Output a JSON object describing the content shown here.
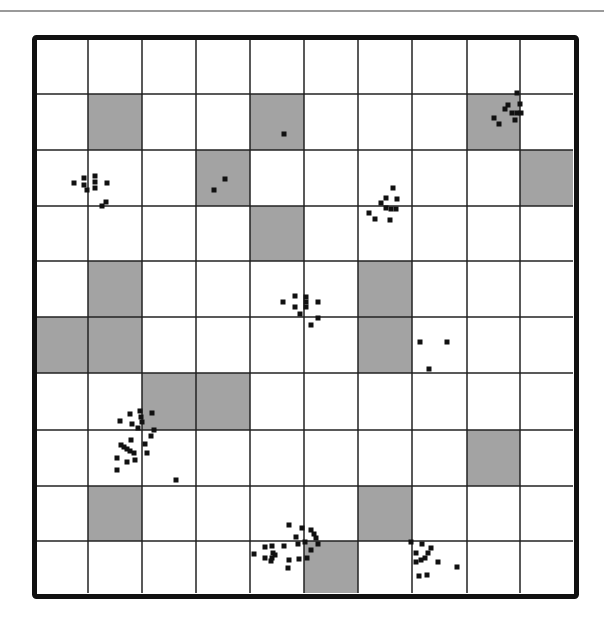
{
  "diagram": {
    "type": "grid-map",
    "rows": 10,
    "cols": 10,
    "frame": {
      "x": 32,
      "y": 35,
      "width": 547,
      "height": 564,
      "border_width": 5
    },
    "inner": {
      "x0": 37,
      "y0": 38,
      "x1": 573,
      "y1": 593
    },
    "col_edges": [
      37,
      88,
      142,
      196,
      250,
      304,
      358,
      412,
      467,
      520,
      573
    ],
    "row_edges": [
      38,
      94,
      150,
      206,
      261,
      317,
      373,
      430,
      486,
      541,
      593
    ],
    "colors": {
      "background": "#ffffff",
      "shaded_cell": "#a3a3a3",
      "grid_line": "#222222",
      "border": "#111111",
      "dot": "#111111",
      "top_rule": "#9a9a9a"
    },
    "shaded_cells": [
      {
        "row": 1,
        "col": 1
      },
      {
        "row": 1,
        "col": 4
      },
      {
        "row": 1,
        "col": 8
      },
      {
        "row": 2,
        "col": 3
      },
      {
        "row": 2,
        "col": 9
      },
      {
        "row": 3,
        "col": 4
      },
      {
        "row": 4,
        "col": 1
      },
      {
        "row": 4,
        "col": 6
      },
      {
        "row": 5,
        "col": 0
      },
      {
        "row": 5,
        "col": 1
      },
      {
        "row": 5,
        "col": 6
      },
      {
        "row": 6,
        "col": 2
      },
      {
        "row": 6,
        "col": 3
      },
      {
        "row": 7,
        "col": 8
      },
      {
        "row": 8,
        "col": 1
      },
      {
        "row": 8,
        "col": 6
      },
      {
        "row": 9,
        "col": 5
      }
    ],
    "dot_size": 5,
    "dots": [
      [
        74,
        183
      ],
      [
        84,
        178
      ],
      [
        84,
        185
      ],
      [
        87,
        190
      ],
      [
        95,
        176
      ],
      [
        95,
        182
      ],
      [
        95,
        188
      ],
      [
        107,
        183
      ],
      [
        102,
        206
      ],
      [
        106,
        202
      ],
      [
        284,
        134
      ],
      [
        225,
        179
      ],
      [
        214,
        190
      ],
      [
        393,
        188
      ],
      [
        386,
        198
      ],
      [
        397,
        199
      ],
      [
        381,
        203
      ],
      [
        386,
        208
      ],
      [
        391,
        209
      ],
      [
        396,
        209
      ],
      [
        369,
        213
      ],
      [
        375,
        219
      ],
      [
        390,
        220
      ],
      [
        517,
        93
      ],
      [
        508,
        105
      ],
      [
        505,
        109
      ],
      [
        520,
        104
      ],
      [
        512,
        113
      ],
      [
        517,
        113
      ],
      [
        521,
        113
      ],
      [
        494,
        118
      ],
      [
        499,
        124
      ],
      [
        515,
        120
      ],
      [
        283,
        302
      ],
      [
        295,
        296
      ],
      [
        295,
        307
      ],
      [
        306,
        297
      ],
      [
        306,
        302
      ],
      [
        306,
        307
      ],
      [
        318,
        302
      ],
      [
        300,
        314
      ],
      [
        318,
        318
      ],
      [
        311,
        325
      ],
      [
        420,
        342
      ],
      [
        447,
        342
      ],
      [
        429,
        369
      ],
      [
        120,
        421
      ],
      [
        130,
        414
      ],
      [
        132,
        424
      ],
      [
        140,
        411
      ],
      [
        141,
        417
      ],
      [
        142,
        422
      ],
      [
        152,
        413
      ],
      [
        138,
        428
      ],
      [
        154,
        430
      ],
      [
        151,
        436
      ],
      [
        121,
        445
      ],
      [
        124,
        447
      ],
      [
        127,
        449
      ],
      [
        130,
        451
      ],
      [
        134,
        453
      ],
      [
        131,
        440
      ],
      [
        145,
        444
      ],
      [
        147,
        453
      ],
      [
        117,
        458
      ],
      [
        127,
        462
      ],
      [
        135,
        460
      ],
      [
        117,
        470
      ],
      [
        176,
        480
      ],
      [
        289,
        525
      ],
      [
        302,
        528
      ],
      [
        296,
        537
      ],
      [
        311,
        530
      ],
      [
        314,
        534
      ],
      [
        316,
        538
      ],
      [
        305,
        542
      ],
      [
        318,
        544
      ],
      [
        265,
        547
      ],
      [
        272,
        546
      ],
      [
        273,
        553
      ],
      [
        272,
        558
      ],
      [
        284,
        546
      ],
      [
        298,
        544
      ],
      [
        254,
        554
      ],
      [
        265,
        558
      ],
      [
        271,
        561
      ],
      [
        275,
        555
      ],
      [
        289,
        560
      ],
      [
        288,
        568
      ],
      [
        299,
        559
      ],
      [
        311,
        550
      ],
      [
        307,
        558
      ],
      [
        411,
        542
      ],
      [
        422,
        544
      ],
      [
        416,
        553
      ],
      [
        431,
        548
      ],
      [
        428,
        553
      ],
      [
        425,
        558
      ],
      [
        421,
        560
      ],
      [
        416,
        562
      ],
      [
        438,
        562
      ],
      [
        457,
        567
      ],
      [
        419,
        576
      ],
      [
        427,
        575
      ]
    ]
  }
}
